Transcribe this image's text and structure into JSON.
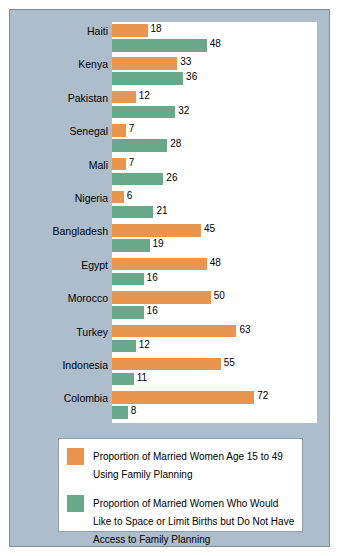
{
  "chart_data": {
    "type": "bar",
    "title": "",
    "xlabel": "",
    "ylabel": "",
    "xlim": [
      0,
      80
    ],
    "grid": false,
    "legend_position": "bottom",
    "orientation": "horizontal",
    "categories": [
      "Haiti",
      "Kenya",
      "Pakistan",
      "Senegal",
      "Mali",
      "Nigeria",
      "Bangladesh",
      "Egypt",
      "Morocco",
      "Turkey",
      "Indonesia",
      "Colombia"
    ],
    "series": [
      {
        "name": "Proportion of Married Women Age 15 to 49 Using Family Planning",
        "color": "#e8964e",
        "values": [
          18,
          33,
          12,
          7,
          7,
          6,
          45,
          48,
          50,
          63,
          55,
          72
        ]
      },
      {
        "name": "Proportion of Married Women Who Would Like to Space or Limit Births but Do Not Have Access to Family Planning",
        "color": "#6aa88a",
        "values": [
          48,
          36,
          32,
          28,
          26,
          21,
          19,
          16,
          16,
          12,
          11,
          8
        ]
      }
    ]
  },
  "legend": {
    "items": [
      {
        "swatch": "orange-swatch",
        "label": "Proportion of Married Women Age 15 to 49 Using Family Planning"
      },
      {
        "swatch": "green-swatch",
        "label": "Proportion of Married Women Who Would Like to Space or Limit Births but Do Not Have Access to Family Planning"
      }
    ]
  }
}
